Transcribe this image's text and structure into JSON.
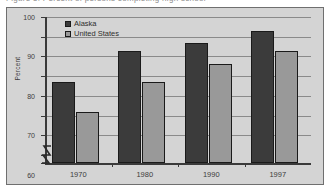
{
  "top_strip": {
    "cut_text": "Figure 5. Percent of persons completing high school"
  },
  "legend": {
    "position": "top-left-inside",
    "items": [
      {
        "label": "Alaska",
        "color": "#3b3b3b"
      },
      {
        "label": "United States",
        "color": "#999999"
      }
    ]
  },
  "axis": {
    "y_title": "Percent",
    "y_tick_labels": [
      "0",
      "30",
      "40",
      "50",
      "60",
      "70",
      "80",
      "90",
      "100"
    ],
    "x_tick_labels": [
      "1970",
      "1980",
      "1990",
      "1997"
    ],
    "break_symbol": "axis-break-zigzag"
  },
  "chart_data": {
    "type": "bar",
    "title": "",
    "subtitle": "",
    "xlabel": "",
    "ylabel": "Percent",
    "categories": [
      "1970",
      "1980",
      "1990",
      "1997"
    ],
    "series": [
      {
        "name": "Alaska",
        "color": "#3b3b3b",
        "values": [
          67,
          83,
          87,
          93
        ]
      },
      {
        "name": "United States",
        "color": "#999999",
        "values": [
          52,
          67,
          76,
          83
        ]
      }
    ],
    "ylim": [
      0,
      100
    ],
    "y_ticks": [
      0,
      30,
      40,
      50,
      60,
      70,
      80,
      90,
      100
    ],
    "y_axis_break": {
      "from": 0,
      "to": 30
    },
    "grid": true,
    "grid_axis": "y",
    "legend_position": "inside top-left",
    "annotations": []
  },
  "colors": {
    "frame_background": "#d4d4d4",
    "frame_border": "#6f6f6f",
    "gridline": "#8a8a8a",
    "axis": "#3a3a3a",
    "page_background": "#ffffff"
  }
}
